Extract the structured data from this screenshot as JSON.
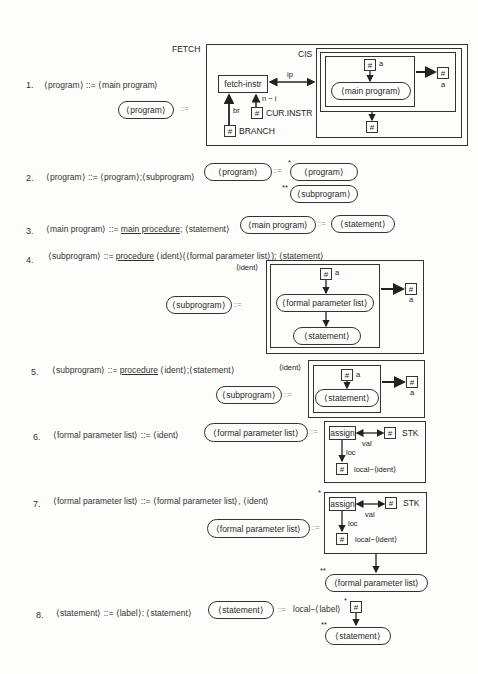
{
  "rules": [
    {
      "number": "1.",
      "text": "⟨program⟩ ::= ⟨main program⟩"
    },
    {
      "number": "2.",
      "text": "⟨program⟩ ::= ⟨program⟩;⟨subprogram⟩"
    },
    {
      "number": "3.",
      "pre": "⟨main program⟩ ::= ",
      "keyword": "main procedure",
      "post": "; ⟨statement⟩"
    },
    {
      "number": "4.",
      "pre": "⟨subprogram⟩ ::= ",
      "keyword": "procedure",
      "post": " ⟨ident⟩(⟨formal parameter list⟩); ⟨statement⟩"
    },
    {
      "number": "5.",
      "pre": "⟨subprogram⟩ ::= ",
      "keyword": "procedure",
      "post": " ⟨ident⟩;⟨statement⟩"
    },
    {
      "number": "6.",
      "text": "⟨formal parameter list⟩ ::= ⟨ident⟩"
    },
    {
      "number": "7.",
      "text": "⟨formal parameter list⟩ ::= ⟨formal parameter list⟩, ⟨ident⟩"
    },
    {
      "number": "8.",
      "text": "⟨statement⟩ ::= ⟨label⟩: ⟨statement⟩"
    }
  ],
  "symbols": {
    "derives": "::=",
    "hash": "#",
    "star": "*",
    "dstar": "**"
  },
  "nonterminals": {
    "program": "⟨program⟩",
    "main_program": "⟨main program⟩",
    "subprogram": "⟨subprogram⟩",
    "statement": "⟨statement⟩",
    "formal_parameter_list": "⟨formal parameter list⟩",
    "ident": "⟨ident⟩"
  },
  "diagram1": {
    "fetch": "FETCH",
    "cis": "CIS",
    "fetch_instr": "fetch-instr",
    "ip": "ip",
    "br": "br",
    "n_minus_i": "n − i",
    "cur_instr": "CUR.INSTR",
    "branch": "BRANCH",
    "a": "a"
  },
  "diagram6": {
    "assign": "assign",
    "val": "val",
    "loc": "loc",
    "stk": "STK",
    "local_ident": "local−⟨ident⟩"
  },
  "diagram8": {
    "local_label": "local−⟨label⟩"
  }
}
